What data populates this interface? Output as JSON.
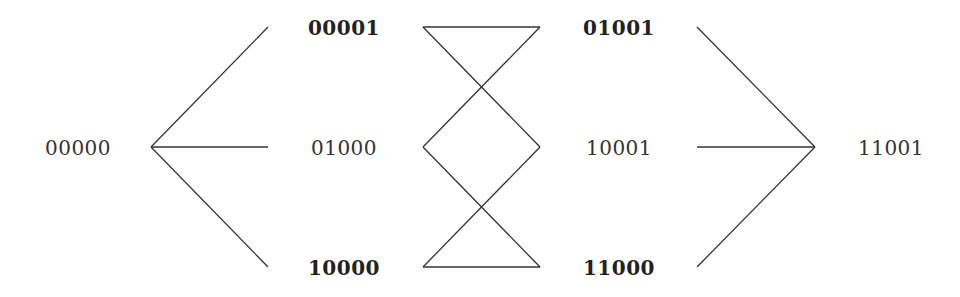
{
  "diagram": {
    "type": "lattice",
    "nodes": [
      {
        "id": "n00000",
        "label": "00000",
        "x": 78,
        "y": 148,
        "bold": false
      },
      {
        "id": "n00001",
        "label": "00001",
        "x": 344,
        "y": 28,
        "bold": true
      },
      {
        "id": "n01000",
        "label": "01000",
        "x": 344,
        "y": 148,
        "bold": false
      },
      {
        "id": "n10000",
        "label": "10000",
        "x": 344,
        "y": 268,
        "bold": true
      },
      {
        "id": "n01001",
        "label": "01001",
        "x": 619,
        "y": 28,
        "bold": true
      },
      {
        "id": "n10001",
        "label": "10001",
        "x": 619,
        "y": 148,
        "bold": false
      },
      {
        "id": "n11000",
        "label": "11000",
        "x": 619,
        "y": 268,
        "bold": true
      },
      {
        "id": "n11001",
        "label": "11001",
        "x": 891,
        "y": 148,
        "bold": false
      }
    ],
    "edges": [
      {
        "from": "n00000",
        "to": "n00001",
        "x1": 151,
        "y1": 147,
        "x2": 268,
        "y2": 27
      },
      {
        "from": "n00000",
        "to": "n01000",
        "x1": 151,
        "y1": 147,
        "x2": 268,
        "y2": 147
      },
      {
        "from": "n00000",
        "to": "n10000",
        "x1": 151,
        "y1": 147,
        "x2": 268,
        "y2": 267
      },
      {
        "from": "n00001",
        "to": "n01001",
        "x1": 423,
        "y1": 27,
        "x2": 540,
        "y2": 27
      },
      {
        "from": "n00001",
        "to": "n10001",
        "x1": 423,
        "y1": 27,
        "x2": 540,
        "y2": 147
      },
      {
        "from": "n01000",
        "to": "n01001",
        "x1": 423,
        "y1": 147,
        "x2": 540,
        "y2": 27
      },
      {
        "from": "n01000",
        "to": "n11000",
        "x1": 423,
        "y1": 147,
        "x2": 540,
        "y2": 267
      },
      {
        "from": "n10000",
        "to": "n10001",
        "x1": 423,
        "y1": 267,
        "x2": 540,
        "y2": 147
      },
      {
        "from": "n10000",
        "to": "n11000",
        "x1": 423,
        "y1": 267,
        "x2": 540,
        "y2": 267
      },
      {
        "from": "n01001",
        "to": "n11001",
        "x1": 697,
        "y1": 27,
        "x2": 815,
        "y2": 147
      },
      {
        "from": "n10001",
        "to": "n11001",
        "x1": 697,
        "y1": 147,
        "x2": 815,
        "y2": 147
      },
      {
        "from": "n11000",
        "to": "n11001",
        "x1": 697,
        "y1": 267,
        "x2": 815,
        "y2": 147
      }
    ],
    "colors": {
      "line": "#333333",
      "text": "#333333",
      "background": "#ffffff"
    }
  }
}
